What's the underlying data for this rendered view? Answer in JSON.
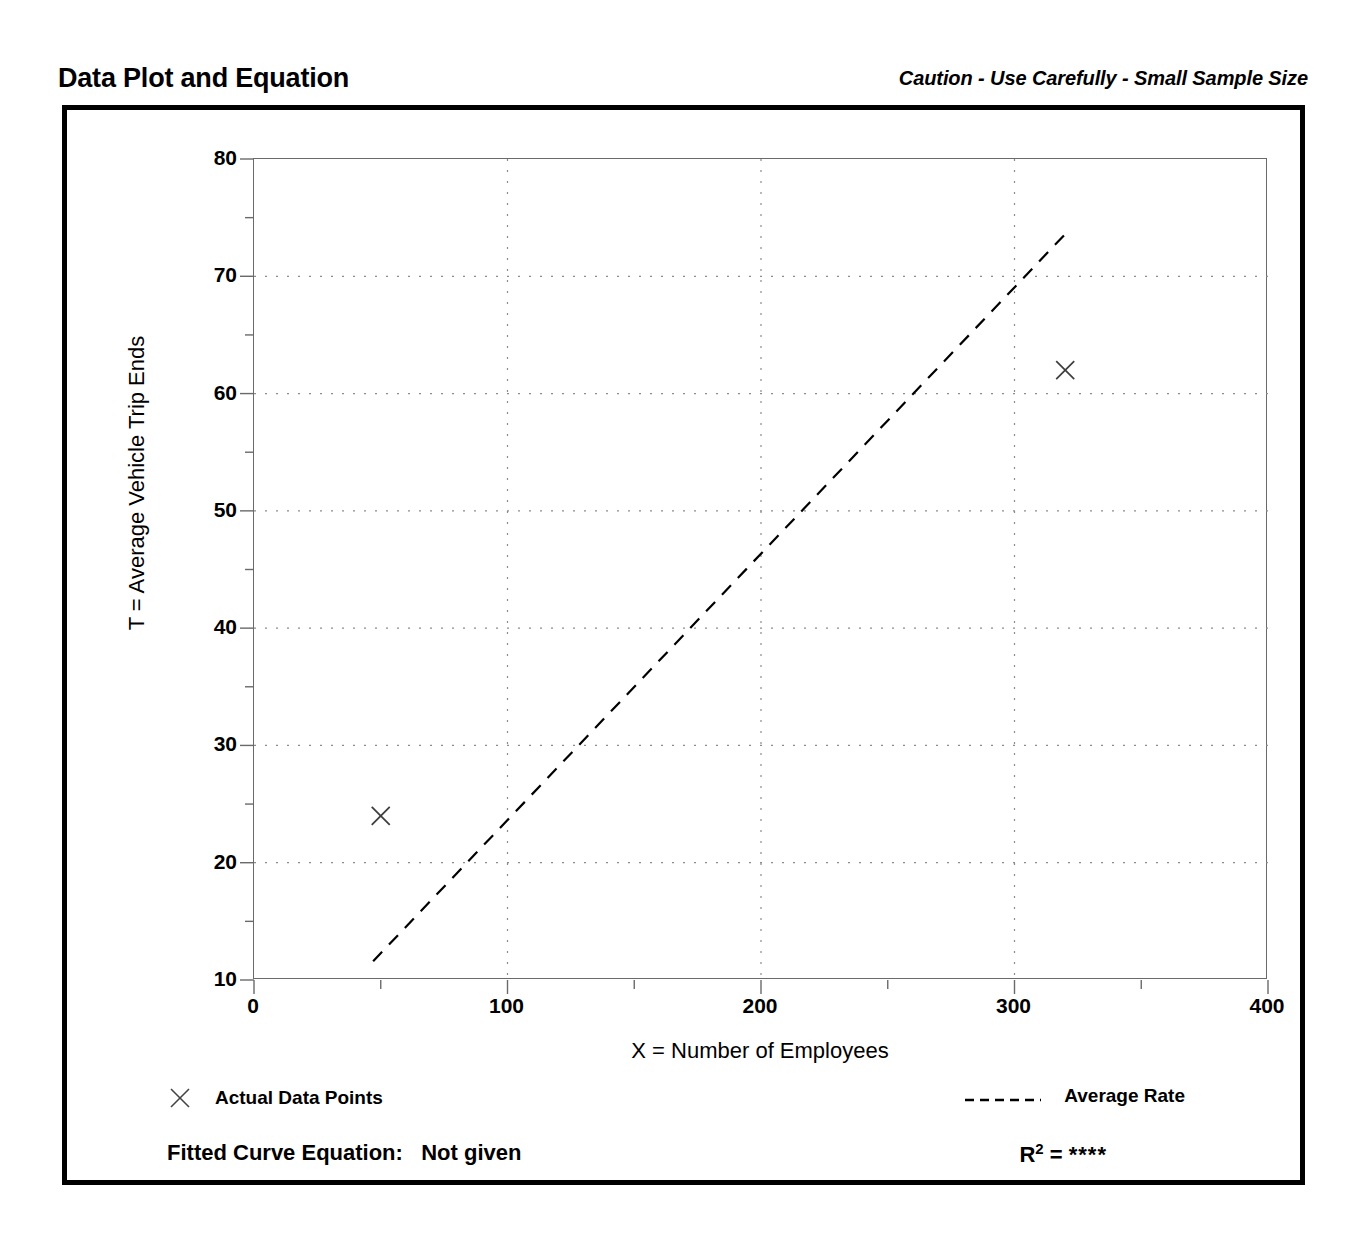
{
  "header": {
    "title": "Data Plot and Equation",
    "caution": "Caution - Use Carefully - Small Sample Size"
  },
  "footer": {
    "fitted_curve_label": "Fitted Curve Equation:",
    "fitted_curve_value": "Not given",
    "r_squared_label": "R",
    "r_squared_exponent": "2",
    "r_squared_equals": " = ",
    "r_squared_value": "****"
  },
  "legend": {
    "data_points_label": "Actual Data Points",
    "average_rate_label": "Average Rate",
    "marker_symbol": "x-marker",
    "line_style": "dashed"
  },
  "colors": {
    "ink": "#000000",
    "axis": "#6a6a6a",
    "grid": "#8c8c8c",
    "frame": "#000000"
  },
  "chart_data": {
    "type": "scatter",
    "title": "Data Plot and Equation",
    "subtitle": "Caution - Use Carefully - Small Sample Size",
    "xlabel": "X = Number of Employees",
    "ylabel": "T = Average Vehicle Trip Ends",
    "xlim": [
      0,
      400
    ],
    "ylim": [
      10,
      80
    ],
    "xticks": [
      0,
      100,
      200,
      300,
      400
    ],
    "yticks": [
      10,
      20,
      30,
      40,
      50,
      60,
      70,
      80
    ],
    "xminor_step": 50,
    "yminor_step": 5,
    "grid": true,
    "grid_style": "dotted",
    "legend_position": "below-plot",
    "series": [
      {
        "name": "Actual Data Points",
        "type": "scatter",
        "marker": "x",
        "points": [
          {
            "x": 50,
            "y": 24
          },
          {
            "x": 320,
            "y": 62
          }
        ]
      },
      {
        "name": "Average Rate",
        "type": "line",
        "style": "dashed",
        "points": [
          {
            "x": 47,
            "y": 11.6
          },
          {
            "x": 320,
            "y": 73.6
          }
        ]
      }
    ]
  }
}
